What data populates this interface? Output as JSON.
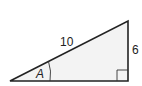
{
  "diagram": {
    "type": "right-triangle",
    "hypotenuse_label": "10",
    "opposite_label": "6",
    "angle_label": "A",
    "has_right_angle_marker": true,
    "colors": {
      "fill": "#f3f3f3",
      "stroke": "#222222",
      "text": "#222222"
    }
  }
}
